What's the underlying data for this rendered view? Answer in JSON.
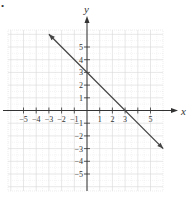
{
  "chart_data": {
    "type": "line",
    "title": "",
    "xlabel": "x",
    "ylabel": "y",
    "xlim": [
      -6,
      6
    ],
    "ylim": [
      -6,
      6
    ],
    "grid": true,
    "x_ticks": [
      -5,
      -4,
      -3,
      -2,
      -1,
      1,
      2,
      3,
      5
    ],
    "y_ticks": [
      5,
      4,
      3,
      2,
      1,
      -1,
      -2,
      -3,
      -4,
      -5
    ],
    "x_tick_labels": [
      "−5",
      "−4",
      "−3",
      "−2",
      "−1",
      "1",
      "2",
      "3",
      "5"
    ],
    "y_tick_labels": [
      "5",
      "4",
      "3",
      "2",
      "1",
      "−1",
      "−2",
      "−3",
      "−4",
      "−5"
    ],
    "series": [
      {
        "name": "line",
        "equation": "y = -x + 3",
        "slope": -1,
        "y_intercept": 3,
        "x_intercept": 3,
        "x": [
          -3,
          6
        ],
        "y": [
          6,
          -3
        ],
        "arrows_both_ends": true,
        "color": "#444444"
      }
    ]
  },
  "marker": "•"
}
